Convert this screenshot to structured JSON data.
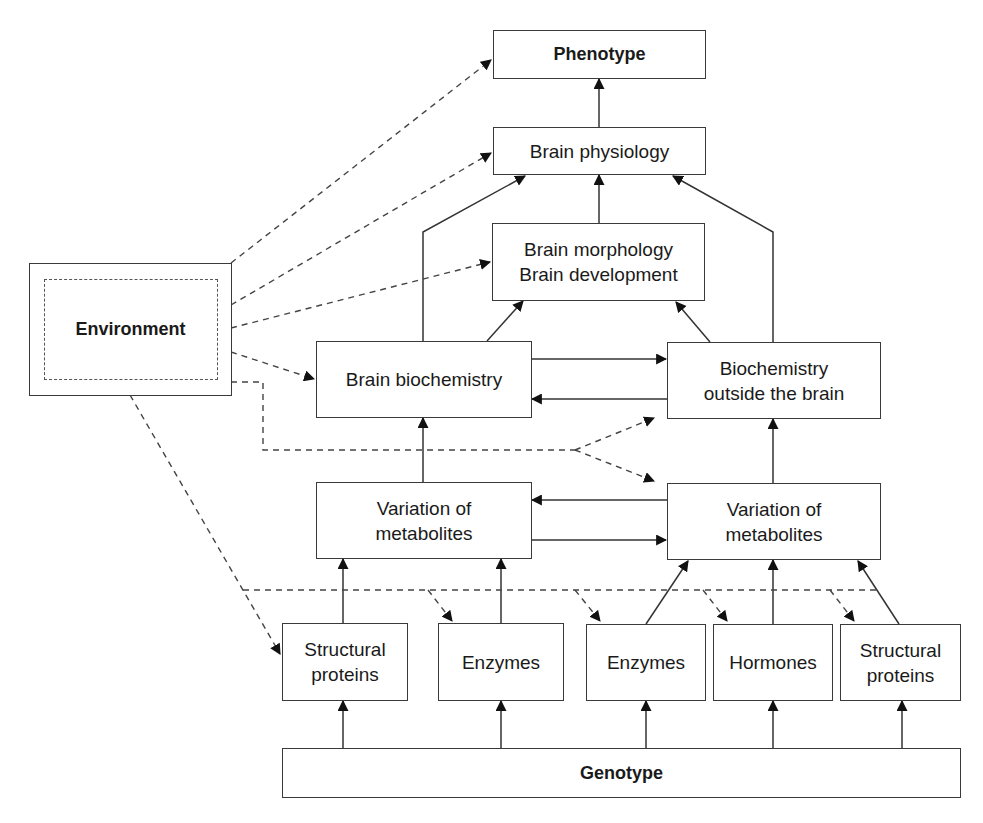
{
  "diagram": {
    "nodes": {
      "phenotype": "Phenotype",
      "brain_physiology": "Brain physiology",
      "brain_morphology": "Brain morphology\nBrain development",
      "environment": "Environment",
      "brain_biochemistry": "Brain biochemistry",
      "biochemistry_outside": "Biochemistry\noutside the brain",
      "variation_left": "Variation of\nmetabolites",
      "variation_right": "Variation of\nmetabolites",
      "structural_left": "Structural\nproteins",
      "enzymes_left": "Enzymes",
      "enzymes_right": "Enzymes",
      "hormones": "Hormones",
      "structural_right": "Structural\nproteins",
      "genotype": "Genotype"
    },
    "edges": {
      "solid": [
        "Brain physiology -> Phenotype",
        "Brain morphology -> Brain physiology",
        "Brain biochemistry -> Brain physiology",
        "Biochemistry outside the brain -> Brain physiology",
        "Brain biochemistry -> Brain morphology",
        "Biochemistry outside the brain -> Brain morphology",
        "Brain biochemistry <-> Biochemistry outside the brain",
        "Variation of metabolites (left) -> Brain biochemistry",
        "Variation of metabolites (right) -> Biochemistry outside the brain",
        "Variation of metabolites (left) <-> Variation of metabolites (right)",
        "Structural proteins (left) -> Variation of metabolites (left)",
        "Enzymes (left) -> Variation of metabolites (left)",
        "Enzymes (right) -> Variation of metabolites (right)",
        "Hormones -> Variation of metabolites (right)",
        "Structural proteins (right) -> Variation of metabolites (right)",
        "Genotype -> Structural proteins, Enzymes, Enzymes, Hormones, Structural proteins"
      ],
      "dashed": [
        "Environment -> Phenotype",
        "Environment -> Brain physiology",
        "Environment -> Brain morphology",
        "Environment -> Brain biochemistry",
        "Environment -> Biochemistry outside the brain",
        "Environment -> Variation of metabolites (right)",
        "Environment -> Structural proteins, Enzymes, Enzymes, Hormones, Structural proteins"
      ]
    }
  }
}
